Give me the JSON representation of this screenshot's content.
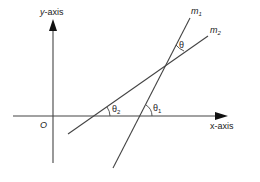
{
  "diagram": {
    "axes": {
      "x_label": "x-axis",
      "y_label": "y-axis",
      "origin_label": "O"
    },
    "lines": [
      {
        "id": "m1",
        "label": "m",
        "subscript": "1",
        "angle_label": "θ",
        "angle_subscript": "1"
      },
      {
        "id": "m2",
        "label": "m",
        "subscript": "2",
        "angle_label": "θ",
        "angle_subscript": "2"
      }
    ],
    "between_angle_label": "θ",
    "colors": {
      "line": "#444444",
      "text": "#222222",
      "background": "#ffffff"
    }
  }
}
